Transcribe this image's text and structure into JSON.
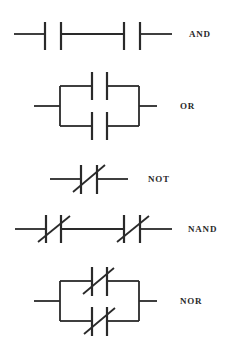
{
  "diagram": {
    "stroke_color": "#2a2a2a",
    "gates": [
      {
        "name": "AND",
        "label": "AND",
        "label_pos": [
          189,
          34
        ],
        "wires": [
          [
            14,
            34,
            45,
            34
          ],
          [
            61,
            34,
            124,
            34
          ],
          [
            140,
            34,
            172,
            34
          ]
        ],
        "plates": [
          [
            45,
            22,
            45,
            50
          ],
          [
            61,
            22,
            61,
            50
          ],
          [
            124,
            22,
            124,
            50
          ],
          [
            140,
            22,
            140,
            50
          ]
        ],
        "slashes": []
      },
      {
        "name": "OR",
        "label": "OR",
        "label_pos": [
          180,
          106
        ],
        "wires": [
          [
            34,
            106,
            60,
            106
          ],
          [
            60,
            86,
            60,
            126
          ],
          [
            60,
            86,
            92,
            86
          ],
          [
            107,
            86,
            139,
            86
          ],
          [
            60,
            126,
            92,
            126
          ],
          [
            107,
            126,
            139,
            126
          ],
          [
            139,
            86,
            139,
            126
          ],
          [
            139,
            106,
            157,
            106
          ]
        ],
        "plates": [
          [
            92,
            72,
            92,
            100
          ],
          [
            107,
            72,
            107,
            100
          ],
          [
            92,
            112,
            92,
            140
          ],
          [
            107,
            112,
            107,
            140
          ]
        ],
        "slashes": []
      },
      {
        "name": "NOT",
        "label": "NOT",
        "label_pos": [
          148,
          179
        ],
        "wires": [
          [
            50,
            179,
            81,
            179
          ],
          [
            97,
            179,
            128,
            179
          ]
        ],
        "plates": [
          [
            81,
            165,
            81,
            194
          ],
          [
            97,
            165,
            97,
            194
          ]
        ],
        "slashes": [
          [
            73,
            192,
            105,
            165
          ]
        ]
      },
      {
        "name": "NAND",
        "label": "NAND",
        "label_pos": [
          188,
          229
        ],
        "wires": [
          [
            15,
            229,
            46,
            229
          ],
          [
            61,
            229,
            124,
            229
          ],
          [
            140,
            229,
            172,
            229
          ]
        ],
        "plates": [
          [
            46,
            215,
            46,
            243
          ],
          [
            61,
            215,
            61,
            243
          ],
          [
            124,
            215,
            124,
            243
          ],
          [
            140,
            215,
            140,
            243
          ]
        ],
        "slashes": [
          [
            38,
            242,
            70,
            216
          ],
          [
            117,
            242,
            149,
            216
          ]
        ]
      },
      {
        "name": "NOR",
        "label": "NOR",
        "label_pos": [
          180,
          301
        ],
        "wires": [
          [
            34,
            301,
            60,
            301
          ],
          [
            60,
            281,
            60,
            321
          ],
          [
            60,
            281,
            92,
            281
          ],
          [
            107,
            281,
            139,
            281
          ],
          [
            60,
            321,
            92,
            321
          ],
          [
            107,
            321,
            139,
            321
          ],
          [
            139,
            281,
            139,
            321
          ],
          [
            139,
            301,
            157,
            301
          ]
        ],
        "plates": [
          [
            92,
            267,
            92,
            296
          ],
          [
            107,
            267,
            107,
            296
          ],
          [
            92,
            307,
            92,
            336
          ],
          [
            107,
            307,
            107,
            336
          ]
        ],
        "slashes": [
          [
            83,
            294,
            114,
            268
          ],
          [
            84,
            334,
            115,
            308
          ]
        ]
      }
    ]
  }
}
